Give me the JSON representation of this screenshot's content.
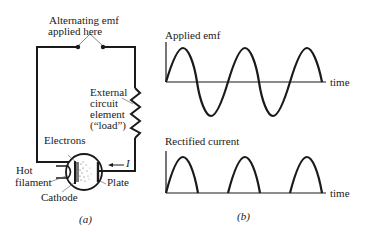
{
  "figure": {
    "part_a": {
      "caption": "(a)",
      "labels": {
        "emf_line1": "Alternating emf",
        "emf_line2": "applied here",
        "load_line1": "External",
        "load_line2": "circuit",
        "load_line3": "element",
        "load_line4": "(“load”)",
        "electrons": "Electrons",
        "hot": "Hot",
        "filament": "filament",
        "cathode": "Cathode",
        "plate": "Plate",
        "current": "I"
      }
    },
    "part_b": {
      "caption": "(b)",
      "top_graph": {
        "title": "Applied emf",
        "x_label": "time",
        "waveform": "sine",
        "cycles": 2.5
      },
      "bottom_graph": {
        "title": "Rectified current",
        "x_label": "time",
        "waveform": "half-wave rectified sine",
        "pulses": 3
      }
    }
  }
}
